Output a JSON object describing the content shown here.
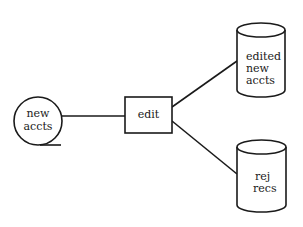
{
  "diagram": {
    "type": "data-flow",
    "nodes": [
      {
        "id": "new-accts",
        "shape": "tape-circle",
        "lines": [
          "new",
          "accts"
        ]
      },
      {
        "id": "edit",
        "shape": "rectangle",
        "lines": [
          "edit"
        ]
      },
      {
        "id": "edited-new-accts",
        "shape": "cylinder",
        "lines": [
          "edited",
          "new",
          "accts"
        ]
      },
      {
        "id": "rej-recs",
        "shape": "cylinder",
        "lines": [
          "rej",
          "recs"
        ]
      }
    ],
    "edges": [
      {
        "from": "new-accts",
        "to": "edit"
      },
      {
        "from": "edit",
        "to": "edited-new-accts"
      },
      {
        "from": "edit",
        "to": "rej-recs"
      }
    ]
  },
  "colors": {
    "line": "#1a1a1a",
    "background": "#ffffff"
  }
}
